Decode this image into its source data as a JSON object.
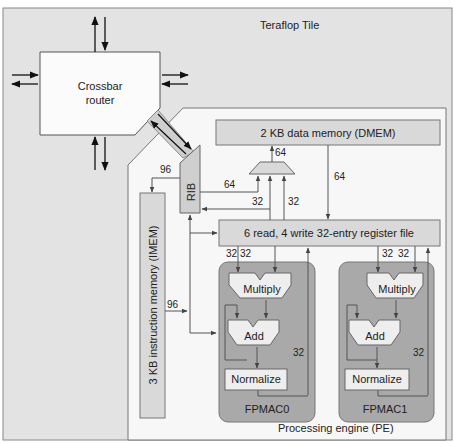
{
  "title": "Teraflop Tile",
  "router": {
    "line1": "Crossbar",
    "line2": "router"
  },
  "pe_label": "Processing engine (PE)",
  "dmem": "2 KB data memory (DMEM)",
  "imem": "3 KB instruction memory (IMEM)",
  "regfile": "6 read, 4 write 32-entry register file",
  "rib": "RIB",
  "fpmac": [
    {
      "name": "FPMAC0",
      "multiply": "Multiply",
      "add": "Add",
      "normalize": "Normalize",
      "in_a": "32",
      "in_b": "32",
      "out": "32"
    },
    {
      "name": "FPMAC1",
      "multiply": "Multiply",
      "add": "Add",
      "normalize": "Normalize",
      "in_a": "32",
      "in_b": "32",
      "out": "32"
    }
  ],
  "widths": {
    "rib_to_imem": "96",
    "imem_to_fpmac": "96",
    "rib_to_mux": "64",
    "mux_to_dmem": "64",
    "dmem_to_regfile": "64",
    "reg_to_mux_a": "32",
    "reg_to_mux_b": "32"
  },
  "colors": {
    "tile_bg": "#e3e3e3",
    "pe_bg": "#f7f7f7",
    "block": "#d9d9d9",
    "fpmac_bg": "#a9a9a9",
    "unit": "#eeeeee",
    "line": "#555555"
  }
}
